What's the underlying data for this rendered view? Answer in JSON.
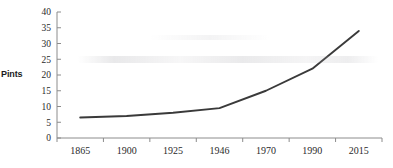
{
  "chart_data": {
    "type": "line",
    "title": "",
    "xlabel": "",
    "ylabel": "Pints",
    "categories": [
      "1865",
      "1900",
      "1925",
      "1946",
      "1970",
      "1990",
      "2015"
    ],
    "values": [
      6.5,
      7,
      8,
      9.5,
      15,
      22,
      34
    ],
    "series": [
      {
        "name": "Pints",
        "values": [
          6.5,
          7,
          8,
          9.5,
          15,
          22,
          34
        ]
      }
    ],
    "ylim": [
      0,
      40
    ],
    "yticks": [
      "0",
      "5",
      "10",
      "15",
      "20",
      "25",
      "30",
      "35",
      "40"
    ],
    "ytick_values": [
      0,
      5,
      10,
      15,
      20,
      25,
      30,
      35,
      40
    ],
    "grid": false,
    "legend": false,
    "legend_position": "none",
    "line_color": "#3a3a3a",
    "axis_color": "#8c8c8c",
    "text_color": "#2a2a2a",
    "background_color": "#ffffff"
  }
}
